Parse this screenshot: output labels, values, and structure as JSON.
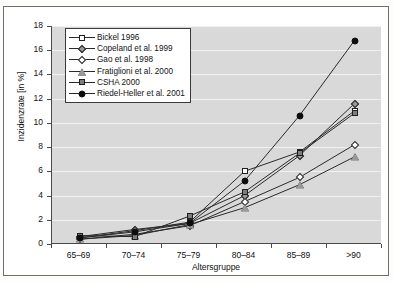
{
  "figure": {
    "axis_color": "#4a4a4a",
    "plot_background": "#d9d9d9",
    "gridline_color": "#f2f2f2",
    "line_color": "#2a2a2a",
    "marker_fill_open": "#ffffff",
    "marker_fill_gray": "#9a9a9a",
    "marker_fill_black": "#0d0d0d"
  },
  "chart_data": {
    "type": "line",
    "title": "",
    "xlabel": "Altersgruppe",
    "ylabel": "Inzidenzrate [in %]",
    "categories": [
      "65–69",
      "70–74",
      "75–79",
      "80–84",
      "85–89",
      ">90"
    ],
    "ylim": [
      0,
      18
    ],
    "yticks": [
      0,
      2,
      4,
      6,
      8,
      10,
      12,
      14,
      16,
      18
    ],
    "grid": true,
    "legend_position": "top-left",
    "series": [
      {
        "name": "Bickel 1996",
        "marker": "square-open",
        "marker_fill": "#ffffff",
        "values": [
          0.5,
          1.1,
          1.8,
          6.0,
          7.6,
          11.0
        ]
      },
      {
        "name": "Copeland et al. 1999",
        "marker": "diamond-gray",
        "marker_fill": "#9a9a9a",
        "values": [
          0.6,
          1.2,
          1.7,
          4.0,
          7.3,
          11.6
        ]
      },
      {
        "name": "Gao et al. 1998",
        "marker": "diamond-open",
        "marker_fill": "#ffffff",
        "values": [
          0.4,
          0.8,
          1.5,
          3.5,
          5.5,
          8.2
        ]
      },
      {
        "name": "Fratiglioni et al. 2000",
        "marker": "triangle-gray",
        "marker_fill": "#9a9a9a",
        "values": [
          0.4,
          0.7,
          1.6,
          3.0,
          4.9,
          7.2
        ]
      },
      {
        "name": "CSHA 2000",
        "marker": "square-gray",
        "marker_fill": "#7d7d7d",
        "values": [
          0.7,
          0.6,
          2.3,
          4.3,
          7.5,
          10.8
        ]
      },
      {
        "name": "Riedel-Heller et al. 2001",
        "marker": "circle-black",
        "marker_fill": "#0d0d0d",
        "values": [
          0.5,
          1.0,
          1.7,
          5.2,
          10.6,
          16.8
        ]
      }
    ]
  }
}
